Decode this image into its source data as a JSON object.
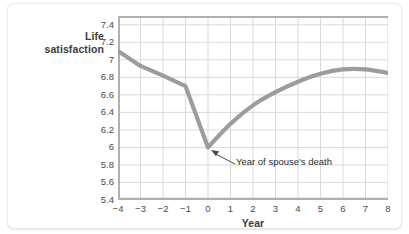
{
  "chart_data": {
    "type": "line",
    "title": "",
    "xlabel": "Year",
    "ylabel": "Life\nsatisfaction",
    "xlim": [
      -4,
      8
    ],
    "ylim": [
      5.4,
      7.5
    ],
    "grid": true,
    "legend": "none",
    "line_color": "#9c9c9c",
    "grid_color": "#d9d9d9",
    "axis_color": "#a8a8a8",
    "x": [
      -4,
      -3,
      -2,
      -1,
      0,
      1,
      2,
      3,
      4,
      5,
      6,
      7,
      8
    ],
    "values": [
      7.1,
      6.93,
      6.82,
      6.7,
      6.0,
      6.27,
      6.48,
      6.63,
      6.75,
      6.84,
      6.89,
      6.89,
      6.85
    ],
    "xticks": [
      "−4",
      "−3",
      "−2",
      "−1",
      "0",
      "1",
      "2",
      "3",
      "4",
      "5",
      "6",
      "7",
      "8"
    ],
    "yticks": [
      "5.4",
      "5.6",
      "5.8",
      "6",
      "6.2",
      "6.4",
      "6.6",
      "6.8",
      "7",
      "7.2",
      "7.4"
    ],
    "ytick_values": [
      5.4,
      5.6,
      5.8,
      6.0,
      6.2,
      6.4,
      6.6,
      6.8,
      7.0,
      7.2,
      7.4
    ],
    "annotations": [
      {
        "text": "Year of spouse's death",
        "point_x": 0,
        "point_y": 6.0
      }
    ]
  }
}
